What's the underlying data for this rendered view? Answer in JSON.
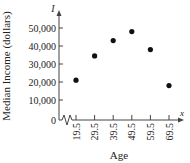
{
  "chart_data": {
    "type": "scatter",
    "title": "",
    "xlabel": "Age",
    "ylabel": "Median Income (dollars)",
    "x_axis_symbol": "x",
    "y_axis_symbol": "I",
    "categories": [
      "19.5",
      "29.5",
      "39.5",
      "49.5",
      "59.5",
      "69.5"
    ],
    "x": [
      19.5,
      29.5,
      39.5,
      49.5,
      59.5,
      69.5
    ],
    "values": [
      21000,
      34500,
      43000,
      48000,
      38000,
      18000
    ],
    "y_ticks": [
      0,
      10000,
      20000,
      30000,
      40000,
      50000
    ],
    "y_tick_labels": [
      "0",
      "10,000",
      "20,000",
      "30,000",
      "40,000",
      "50,000"
    ],
    "ylim": [
      0,
      55000
    ],
    "x_axis_break": true,
    "grid": false,
    "legend": null
  },
  "colors": {
    "point": "#111111",
    "axis": "#444444",
    "text": "#222222"
  }
}
